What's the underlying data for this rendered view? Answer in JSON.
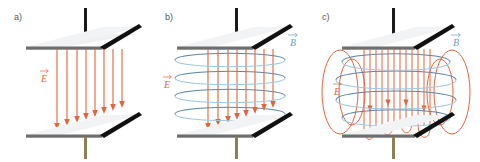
{
  "figure": {
    "background_color": "#ffffff",
    "width": 480,
    "height": 162
  },
  "colors": {
    "e_field": "#e2653f",
    "e_field_light": "#ef9a78",
    "b_field_front": "#9fc8e0",
    "b_field_back": "#5b86a8",
    "plate_face": "#eef0f2",
    "plate_edge": "#6e6e6e",
    "lead_top": "#1a1a1a",
    "lead_bottom": "#8a8257",
    "label_text": "#58585a"
  },
  "panels": [
    {
      "id": "a",
      "label": "a)",
      "caption_labels": [
        {
          "name": "e-field-label",
          "text": "E",
          "color": "#e2653f"
        }
      ],
      "shows": "uniform electric field between the plates",
      "e_field_lines": 8,
      "b_field_rings": 0
    },
    {
      "id": "b",
      "label": "b)",
      "caption_labels": [
        {
          "name": "e-field-label",
          "text": "E",
          "color": "#e2653f"
        },
        {
          "name": "b-field-label",
          "text": "B",
          "color": "#6f9fc4"
        }
      ],
      "shows": "electric field plus encircling magnetic field rings",
      "e_field_lines": 8,
      "b_field_rings": 4
    },
    {
      "id": "c",
      "label": "c)",
      "caption_labels": [
        {
          "name": "e-field-label",
          "text": "E",
          "color": "#e2653f"
        },
        {
          "name": "b-field-label",
          "text": "B",
          "color": "#6f9fc4"
        }
      ],
      "shows": "radiating electromagnetic field with closed electric loops and magnetic rings",
      "e_field_lines": 14,
      "b_field_rings": 4,
      "e_field_loops": 4
    }
  ],
  "capacitor": {
    "top_plate": {
      "name": "top-plate",
      "lead": "top-lead",
      "lead_color": "#1a1a1a"
    },
    "bottom_plate": {
      "name": "bottom-plate",
      "lead": "bottom-lead",
      "lead_color": "#8a8257"
    },
    "diagonal_lead": {
      "name": "diagonal-lead",
      "color": "#111111"
    }
  }
}
